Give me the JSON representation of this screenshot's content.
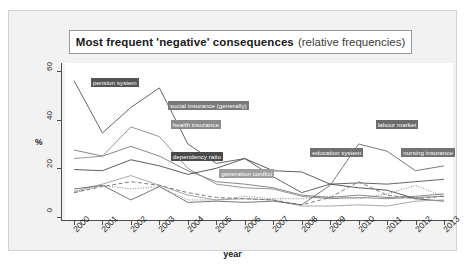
{
  "title": {
    "main": "Most frequent 'negative' consequences",
    "sub": "(relative frequencies)"
  },
  "axes": {
    "ylabel": "%",
    "xlabel": "year",
    "yticks": [
      "0",
      "20",
      "40",
      "60"
    ],
    "xticks": [
      "2000",
      "2001",
      "2002",
      "2003",
      "2004",
      "2005",
      "2006",
      "2007",
      "2008",
      "2009",
      "2010",
      "2011",
      "2012",
      "2013"
    ]
  },
  "chart_data": {
    "type": "line",
    "title": "Most frequent 'negative' consequences (relative frequencies)",
    "xlabel": "year",
    "ylabel": "%",
    "xlim": [
      2000,
      2013
    ],
    "ylim": [
      0,
      62
    ],
    "grid": false,
    "legend": "direct-labels",
    "x": [
      2000,
      2001,
      2002,
      2003,
      2004,
      2005,
      2006,
      2007,
      2008,
      2009,
      2010,
      2011,
      2012,
      2013
    ],
    "series": [
      {
        "name": "pension system",
        "color": "#555555",
        "style": "solid",
        "label_x": 2000.6,
        "label_y": 55.5,
        "values": [
          56.0,
          34.5,
          45.0,
          53.0,
          30.0,
          22.0,
          24.0,
          16.5,
          10.0,
          13.5,
          14.0,
          13.5,
          14.5,
          15.5
        ]
      },
      {
        "name": "social insurance (generally)",
        "color": "#7a7a7a",
        "style": "solid",
        "label_x": 2003.3,
        "label_y": 46.0,
        "values": [
          27.5,
          25.0,
          29.0,
          25.0,
          19.0,
          14.5,
          13.5,
          12.0,
          9.0,
          8.0,
          9.0,
          8.0,
          8.5,
          9.5
        ]
      },
      {
        "name": "health insurance",
        "color": "#8a8a8a",
        "style": "solid",
        "label_x": 2003.4,
        "label_y": 38.0,
        "values": [
          24.0,
          25.0,
          37.0,
          33.0,
          20.0,
          13.5,
          12.0,
          11.5,
          8.5,
          7.5,
          8.0,
          7.5,
          8.0,
          8.5
        ]
      },
      {
        "name": "dependency ratio",
        "color": "#4a4a4a",
        "style": "solid",
        "label_x": 2003.4,
        "label_y": 25.0,
        "values": [
          19.5,
          19.0,
          23.5,
          21.0,
          17.5,
          20.0,
          24.0,
          19.0,
          18.5,
          13.5,
          12.0,
          11.0,
          7.5,
          6.5
        ]
      },
      {
        "name": "generation conflict",
        "color": "#9e9e9e",
        "style": "solid",
        "label_x": 2005.1,
        "label_y": 18.0,
        "values": [
          10.5,
          13.5,
          17.0,
          13.0,
          9.0,
          7.0,
          7.5,
          7.0,
          4.5,
          4.5,
          5.0,
          4.5,
          6.5,
          7.0
        ]
      },
      {
        "name": "labour market",
        "color": "#6b6b6b",
        "style": "solid",
        "label_x": 2010.6,
        "label_y": 38.0,
        "values": [
          11.5,
          13.0,
          7.0,
          12.5,
          6.0,
          6.5,
          6.0,
          6.5,
          5.0,
          13.0,
          30.0,
          27.0,
          19.0,
          21.0
        ]
      },
      {
        "name": "education system",
        "color": "#707070",
        "style": "dashed",
        "label_x": 2008.3,
        "label_y": 26.5,
        "values": [
          10.0,
          12.5,
          14.5,
          13.0,
          10.0,
          8.0,
          7.5,
          7.0,
          5.0,
          8.0,
          14.5,
          9.0,
          7.5,
          8.5
        ]
      },
      {
        "name": "nursing insurance",
        "color": "#737373",
        "style": "dotted",
        "label_x": 2011.5,
        "label_y": 26.5,
        "values": [
          10.0,
          13.0,
          11.5,
          12.5,
          7.0,
          7.0,
          8.5,
          7.5,
          7.5,
          8.5,
          7.5,
          9.5,
          13.0,
          8.5
        ]
      }
    ]
  }
}
